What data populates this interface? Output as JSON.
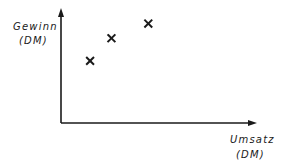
{
  "chart_data": {
    "type": "scatter",
    "title": "",
    "xlabel": "Umsatz (DM)",
    "ylabel": "Gewinn (DM)",
    "xlabel_lines": [
      "Umsatz",
      "(DM)"
    ],
    "ylabel_lines": [
      "Gewinn",
      "(DM)"
    ],
    "x_ticks": [],
    "y_ticks": [],
    "grid": false,
    "legend": null,
    "marker": "x",
    "marker_color": "#1a1a1a",
    "axis_color": "#1a1a1a",
    "xlim": [
      0,
      10
    ],
    "ylim": [
      0,
      10
    ],
    "series": [
      {
        "name": "Gewinn vs. Umsatz",
        "points": [
          {
            "x": 1.5,
            "y": 5.5
          },
          {
            "x": 2.6,
            "y": 7.5
          },
          {
            "x": 4.5,
            "y": 8.8
          }
        ]
      }
    ]
  },
  "layout": {
    "origin_px": [
      61,
      123
    ],
    "x_axis_end_px": 257,
    "y_axis_end_px": 8
  }
}
